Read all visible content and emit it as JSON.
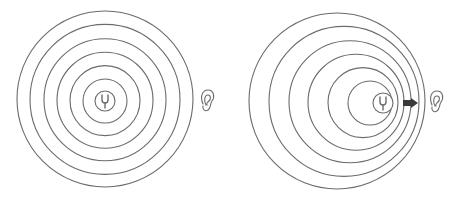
{
  "diagram": {
    "stroke_color": "#6b6b6b",
    "arrow_color": "#3a3a3a",
    "panels": [
      {
        "name": "stationary-source",
        "source_icon": "tuning-fork-icon",
        "listener_icon": "ear-icon",
        "source_center": [
          105,
          101
        ],
        "wave_radii": [
          88,
          75,
          61,
          48,
          35,
          22
        ],
        "wave_centers_x": [
          105,
          105,
          105,
          105,
          105,
          105
        ],
        "source_ring_radius": 10,
        "listener_position": [
          208,
          101
        ]
      },
      {
        "name": "moving-source",
        "source_icon": "tuning-fork-icon",
        "listener_icon": "ear-icon",
        "motion_arrow": "arrow-right-icon",
        "source_center": [
          383,
          103
        ],
        "wave_radii": [
          88,
          75,
          61,
          48,
          35,
          22
        ],
        "wave_centers_x": [
          337,
          344,
          350,
          356,
          363,
          370
        ],
        "source_ring_radius": 10,
        "listener_position": [
          437,
          102
        ]
      }
    ]
  }
}
